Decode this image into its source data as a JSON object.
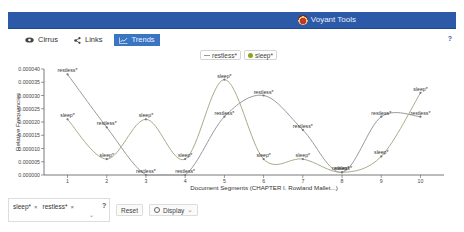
{
  "header": {
    "brand": "Voyant Tools",
    "accent": "#2c5aa8"
  },
  "tabs": [
    {
      "label": "Cirrus",
      "icon": "eye-icon",
      "active": false
    },
    {
      "label": "Links",
      "icon": "share-icon",
      "active": false
    },
    {
      "label": "Trends",
      "icon": "line-chart-icon",
      "active": true
    }
  ],
  "help_label": "?",
  "legend": [
    {
      "label": "restless*",
      "marker": "line"
    },
    {
      "label": "sleep*",
      "marker": "dot"
    }
  ],
  "chart_data": {
    "type": "line",
    "title": "",
    "xlabel": "Document Segments (CHAPTER I. Rowland Mallet...)",
    "ylabel": "Relative Frequencies",
    "x": [
      1,
      2,
      3,
      4,
      5,
      6,
      7,
      8,
      9,
      10
    ],
    "x_tick_labels": [
      "1",
      "2",
      "3",
      "4",
      "5",
      "6",
      "7",
      "8",
      "9",
      "10"
    ],
    "ylim": [
      0,
      4e-05
    ],
    "y_ticks": [
      0,
      5e-06,
      1e-05,
      1.5e-05,
      2e-05,
      2.5e-05,
      3e-05,
      3.5e-05,
      4e-05
    ],
    "y_tick_labels": [
      "0.000000",
      "0.000005",
      "0.000010",
      "0.000015",
      "0.000020",
      "0.000025",
      "0.000030",
      "0.000035",
      "0.000040"
    ],
    "grid": false,
    "legend_position": "top-center",
    "series": [
      {
        "name": "restless*",
        "label": "restless*",
        "color": "#9a9a9a",
        "values": [
          3.8e-05,
          1.8e-05,
          0.0,
          0.0,
          2.2e-05,
          3e-05,
          1.7e-05,
          1e-06,
          2.2e-05,
          2.2e-05
        ]
      },
      {
        "name": "sleep*",
        "label": "sleep*",
        "color": "#a8ad8a",
        "values": [
          2.1e-05,
          6e-06,
          2.1e-05,
          6e-06,
          3.6e-05,
          6e-06,
          6e-06,
          1e-06,
          7e-06,
          3.1e-05
        ]
      }
    ]
  },
  "bottom": {
    "terms": [
      {
        "label": "sleep*",
        "remove": "×"
      },
      {
        "label": "restless*",
        "remove": "×"
      }
    ],
    "caret": "⌄",
    "help": "?",
    "reset_label": "Reset",
    "display_label": "Display",
    "display_caret": "⌄"
  }
}
